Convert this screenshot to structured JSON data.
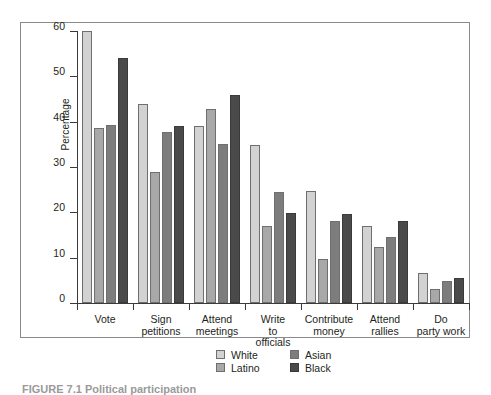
{
  "chart_data": {
    "type": "bar",
    "title": "",
    "xlabel": "",
    "ylabel": "Percentage",
    "ylim": [
      0,
      60
    ],
    "yticks": [
      0,
      10,
      20,
      30,
      40,
      50,
      60
    ],
    "ytick_labels": [
      "0",
      "10",
      "20",
      "30",
      "40",
      "50",
      "60"
    ],
    "grid": false,
    "legend_position": "bottom-center",
    "categories": [
      "Vote",
      "Sign petitions",
      "Attend meetings",
      "Write to officials",
      "Contribute money",
      "Attend rallies",
      "Do party work"
    ],
    "category_label_lines": [
      [
        "Vote"
      ],
      [
        "Sign",
        "petitions"
      ],
      [
        "Attend",
        "meetings"
      ],
      [
        "Write",
        "to",
        "officials"
      ],
      [
        "Contribute",
        "money"
      ],
      [
        "Attend",
        "rallies"
      ],
      [
        "Do",
        "party work"
      ]
    ],
    "series": [
      {
        "name": "White",
        "color": "#d2d2d2",
        "values": [
          60.0,
          44.0,
          39.0,
          34.8,
          24.8,
          16.9,
          6.7
        ]
      },
      {
        "name": "Latino",
        "color": "#a8a8a8",
        "values": [
          38.5,
          29.0,
          42.7,
          17.0,
          9.8,
          12.3,
          3.0
        ]
      },
      {
        "name": "Asian",
        "color": "#7d7d7d",
        "values": [
          39.3,
          37.8,
          35.0,
          24.4,
          18.0,
          14.6,
          4.8
        ]
      },
      {
        "name": "Black",
        "color": "#4a4a4a",
        "values": [
          54.0,
          39.0,
          45.8,
          19.8,
          19.6,
          18.1,
          5.6
        ]
      }
    ]
  },
  "legend": {
    "entries": [
      {
        "label": "White"
      },
      {
        "label": "Asian"
      },
      {
        "label": "Latino"
      },
      {
        "label": "Black"
      }
    ]
  },
  "caption": {
    "text": "FIGURE 7.1   Political participation"
  }
}
